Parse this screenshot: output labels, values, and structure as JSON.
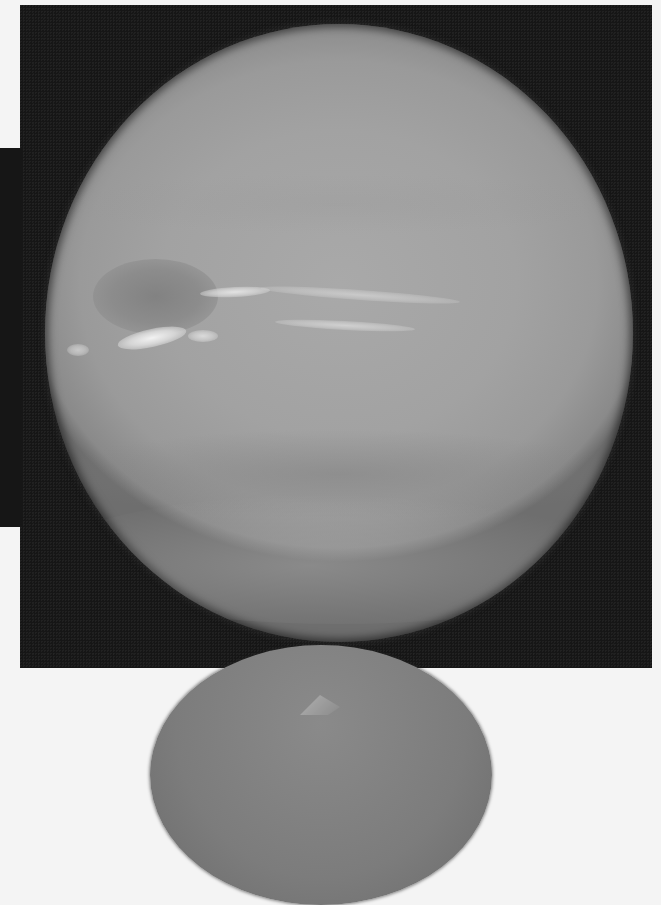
{
  "image": {
    "subject": "planet",
    "description": "Grayscale photograph of a banded gas-giant planet with a dark spot and bright streaky clouds against black space; a second smaller sphere is partially visible below",
    "colors": {
      "space": "#161616",
      "planet_surface": "#a4a4a4",
      "dark_spot": "#828282",
      "bright_clouds": "#f2f2f2",
      "page_background": "#f4f4f4",
      "lower_sphere": "#7c7c7c"
    },
    "features": [
      {
        "name": "dark-spot",
        "position": "left-center"
      },
      {
        "name": "bright-cloud-streaks",
        "position": "center-left, equatorial"
      },
      {
        "name": "darker-band",
        "position": "lower hemisphere"
      },
      {
        "name": "lower-sphere",
        "position": "bottom center, partially visible"
      }
    ]
  }
}
